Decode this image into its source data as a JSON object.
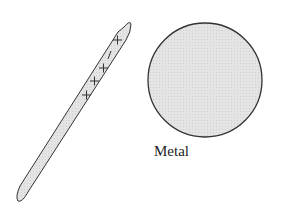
{
  "diagram": {
    "rod": {
      "name": "charged-rod",
      "charges": [
        "+",
        "+",
        "+",
        "+",
        "-"
      ]
    },
    "sphere": {
      "name": "metal-sphere",
      "label": "Metal"
    },
    "colors": {
      "fill": "#e2e2e2",
      "stroke": "#333333"
    }
  }
}
